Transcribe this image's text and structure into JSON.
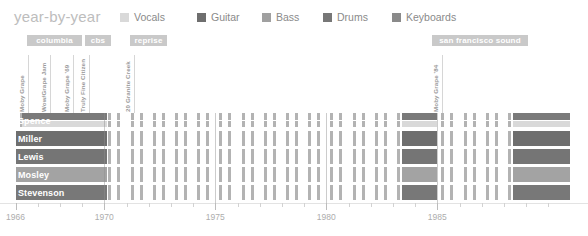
{
  "header": {
    "title": "year-by-year"
  },
  "legend": {
    "items": [
      {
        "label": "Vocals",
        "color": "#d9d9d9",
        "x": 0
      },
      {
        "label": "Guitar",
        "color": "#6e6e6e",
        "x": 77
      },
      {
        "label": "Bass",
        "color": "#a0a0a0",
        "x": 142
      },
      {
        "label": "Drums",
        "color": "#777777",
        "x": 203
      },
      {
        "label": "Keyboards",
        "color": "#8a8a8a",
        "x": 272
      }
    ]
  },
  "record_labels": [
    {
      "name": "columbia",
      "x": 27,
      "width": 55,
      "color": "#c9c9c9"
    },
    {
      "name": "cbs",
      "x": 85,
      "width": 26,
      "color": "#c9c9c9"
    },
    {
      "name": "reprise",
      "x": 130,
      "width": 37,
      "color": "#c9c9c9"
    },
    {
      "name": "san francisco sound",
      "x": 432,
      "width": 96,
      "color": "#c9c9c9"
    }
  ],
  "albums": [
    {
      "title": "Moby Grape",
      "x": 28
    },
    {
      "title": "Wow/Grape Jam",
      "x": 50
    },
    {
      "title": "Moby Grape '69",
      "x": 73
    },
    {
      "title": "Truly Fine Citizen",
      "x": 89
    },
    {
      "title": "20 Granite Creek",
      "x": 134
    },
    {
      "title": "Moby Grape '84",
      "x": 442
    }
  ],
  "chart_data": {
    "type": "timeline",
    "title": "year-by-year",
    "xlabel": "",
    "ylabel": "",
    "xlim": [
      1966,
      1991
    ],
    "grid": true,
    "legend_position": "top",
    "axis": {
      "ticks": [
        {
          "year": 1966,
          "label": "1966",
          "major": true
        },
        {
          "year": 1967,
          "label": "",
          "major": false
        },
        {
          "year": 1968,
          "label": "",
          "major": false
        },
        {
          "year": 1969,
          "label": "",
          "major": false
        },
        {
          "year": 1970,
          "label": "1970",
          "major": true
        },
        {
          "year": 1971,
          "label": "",
          "major": false
        },
        {
          "year": 1972,
          "label": "",
          "major": false
        },
        {
          "year": 1973,
          "label": "",
          "major": false
        },
        {
          "year": 1974,
          "label": "",
          "major": false
        },
        {
          "year": 1975,
          "label": "1975",
          "major": true
        },
        {
          "year": 1976,
          "label": "",
          "major": false
        },
        {
          "year": 1977,
          "label": "",
          "major": false
        },
        {
          "year": 1978,
          "label": "",
          "major": false
        },
        {
          "year": 1979,
          "label": "",
          "major": false
        },
        {
          "year": 1980,
          "label": "1980",
          "major": true
        },
        {
          "year": 1981,
          "label": "",
          "major": false
        },
        {
          "year": 1982,
          "label": "",
          "major": false
        },
        {
          "year": 1983,
          "label": "",
          "major": false
        },
        {
          "year": 1984,
          "label": "",
          "major": false
        },
        {
          "year": 1985,
          "label": "1985",
          "major": true
        },
        {
          "year": 1986,
          "label": "",
          "major": false
        },
        {
          "year": 1987,
          "label": "",
          "major": false
        },
        {
          "year": 1988,
          "label": "",
          "major": false
        },
        {
          "year": 1989,
          "label": "",
          "major": false
        },
        {
          "year": 1990,
          "label": "",
          "major": false
        }
      ],
      "gridlines": [
        1970,
        1975,
        1980,
        1985
      ]
    },
    "rows": [
      {
        "name": "Spence",
        "instruments": [
          "Vocals",
          "Guitar"
        ],
        "split": true,
        "colors": [
          "#7a7a7a",
          "#d9d9d9"
        ],
        "active": [
          [
            1966.3,
            1970.1
          ],
          [
            1983.4,
            1985.0
          ],
          [
            1988.4,
            1991.0
          ]
        ]
      },
      {
        "name": "Miller",
        "instruments": [
          "Guitar"
        ],
        "split": false,
        "colors": [
          "#6e6e6e"
        ],
        "active": [
          [
            1966.0,
            1970.1
          ],
          [
            1983.4,
            1985.0
          ],
          [
            1988.4,
            1991.0
          ]
        ]
      },
      {
        "name": "Lewis",
        "instruments": [
          "Guitar"
        ],
        "split": false,
        "colors": [
          "#757575"
        ],
        "active": [
          [
            1966.0,
            1970.1
          ],
          [
            1983.4,
            1985.0
          ],
          [
            1988.4,
            1991.0
          ]
        ]
      },
      {
        "name": "Mosley",
        "instruments": [
          "Bass"
        ],
        "split": false,
        "colors": [
          "#a3a3a3"
        ],
        "active": [
          [
            1966.0,
            1970.1
          ],
          [
            1983.4,
            1985.0
          ],
          [
            1988.4,
            1991.0
          ]
        ]
      },
      {
        "name": "Stevenson",
        "instruments": [
          "Drums"
        ],
        "split": false,
        "colors": [
          "#787878"
        ],
        "active": [
          [
            1966.0,
            1970.1
          ],
          [
            1983.4,
            1985.0
          ],
          [
            1988.4,
            1991.0
          ]
        ]
      }
    ],
    "tick_stripe_color": "#b3b3b3",
    "note": "Dense vertical hatch stripes mark every year; solid blocks mark periods of album activity."
  }
}
